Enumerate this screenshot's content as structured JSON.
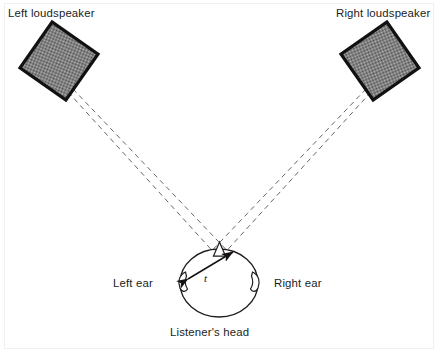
{
  "figure": {
    "background_color": "#ffffff",
    "frame_color": "#f0eeec",
    "ink_color": "#201d1c"
  },
  "labels": {
    "left_loudspeaker": "Left loudspeaker",
    "right_loudspeaker": "Right loudspeaker",
    "left_ear": "Left ear",
    "right_ear": "Right ear",
    "listeners_head": "Listener's head",
    "time_delay_symbol": "t"
  },
  "speakers": [
    {
      "name": "left-loudspeaker",
      "center_x": 59,
      "center_y": 61,
      "size": 56,
      "rotation_deg": 35,
      "fill": "#9c9c9c",
      "stroke": "#111111",
      "stroke_width": 3
    },
    {
      "name": "right-loudspeaker",
      "center_x": 380,
      "center_y": 61,
      "size": 56,
      "rotation_deg": -35,
      "fill": "#8f8f8f",
      "stroke": "#111111",
      "stroke_width": 3
    }
  ],
  "head": {
    "center_x": 219,
    "center_y": 282,
    "radius_x": 39,
    "radius_y": 34,
    "stroke": "#201d1c",
    "stroke_width": 1.3,
    "fill": "#ffffff"
  },
  "nose": {
    "tip_x": 219,
    "tip_y": 243,
    "base_left_x": 213,
    "base_left_y": 254,
    "base_right_x": 226,
    "base_right_y": 254
  },
  "ears": [
    {
      "name": "left-ear-shape",
      "x": 181,
      "y": 279
    },
    {
      "name": "right-ear-shape",
      "x": 257,
      "y": 279
    }
  ],
  "sound_paths": [
    {
      "name": "left-speaker-to-left-ear",
      "x1": 68,
      "y1": 92,
      "x2": 228,
      "y2": 268
    },
    {
      "name": "left-speaker-to-right-ear",
      "x1": 72,
      "y1": 90,
      "x2": 256,
      "y2": 281
    },
    {
      "name": "right-speaker-to-right-ear",
      "x1": 371,
      "y1": 92,
      "x2": 211,
      "y2": 268
    },
    {
      "name": "right-speaker-to-left-ear",
      "x1": 367,
      "y1": 90,
      "x2": 183,
      "y2": 281
    }
  ],
  "delay_arrow": {
    "name": "interaural-delay-arrow",
    "from_x": 186,
    "from_y": 279,
    "to_x": 233,
    "to_y": 254,
    "label_x": 206,
    "label_y": 281
  },
  "label_positions": {
    "left_loudspeaker": {
      "x": 8,
      "y": 17
    },
    "right_loudspeaker": {
      "x": 336,
      "y": 17
    },
    "left_ear": {
      "x": 113,
      "y": 287
    },
    "right_ear": {
      "x": 274,
      "y": 287
    },
    "listeners_head": {
      "x": 170,
      "y": 336
    }
  }
}
